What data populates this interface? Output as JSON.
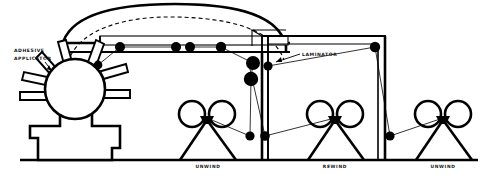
{
  "diagram": {
    "style": {
      "line_color": "#000000",
      "background": "#ffffff",
      "roller_fill": "#000000"
    },
    "labels": {
      "adhesive_applicator_line1": "ADHESIVE",
      "adhesive_applicator_line2": "APPLICATOR",
      "laminator": "LAMINATOR",
      "unwind_left": "UNWIND",
      "rewind_center": "REWIND",
      "unwind_right": "UNWIND"
    },
    "stations": [
      {
        "name": "adhesive-applicator",
        "label": "ADHESIVE APPLICATOR",
        "x": 75,
        "y": 110,
        "type": "spoked-wheel-on-pedestal"
      },
      {
        "name": "unwind-stand-left",
        "label": "UNWIND",
        "x": 208,
        "y": 130,
        "type": "a-frame-roll-stand"
      },
      {
        "name": "rewind-stand-center",
        "label": "REWIND",
        "x": 335,
        "y": 130,
        "type": "a-frame-roll-stand"
      },
      {
        "name": "unwind-stand-right",
        "label": "UNWIND",
        "x": 443,
        "y": 130,
        "type": "a-frame-roll-stand"
      },
      {
        "name": "laminator",
        "label": "LAMINATOR",
        "x": 262,
        "y": 70,
        "type": "roller-nip-cluster"
      }
    ],
    "rollers": [
      {
        "name": "roller-applicator-top",
        "cx": 98,
        "cy": 65,
        "r": 4.4
      },
      {
        "name": "roller-beam-1",
        "cx": 120,
        "cy": 47,
        "r": 5.0
      },
      {
        "name": "roller-beam-2",
        "cx": 176,
        "cy": 47,
        "r": 5.0
      },
      {
        "name": "roller-beam-3",
        "cx": 190,
        "cy": 47,
        "r": 5.0
      },
      {
        "name": "roller-beam-4",
        "cx": 221,
        "cy": 47,
        "r": 5.2
      },
      {
        "name": "roller-laminator-top",
        "cx": 253,
        "cy": 63,
        "r": 7.0
      },
      {
        "name": "roller-laminator-side",
        "cx": 268,
        "cy": 66,
        "r": 4.6
      },
      {
        "name": "roller-laminator-lower",
        "cx": 251,
        "cy": 79,
        "r": 7.2
      },
      {
        "name": "roller-post-top-right",
        "cx": 375,
        "cy": 47,
        "r": 5.2
      },
      {
        "name": "roller-floor-left",
        "cx": 250,
        "cy": 136,
        "r": 4.6
      },
      {
        "name": "roller-floor-mid",
        "cx": 265,
        "cy": 136,
        "r": 4.8
      },
      {
        "name": "roller-floor-right",
        "cx": 390,
        "cy": 136,
        "r": 4.6
      }
    ],
    "structure": {
      "floor_y": 160,
      "top_beam_y": 47,
      "frame_left_x": 95,
      "frame_right_x": 385,
      "arch_peak_y": 8
    }
  }
}
